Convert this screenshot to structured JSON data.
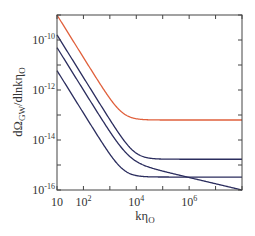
{
  "chart_data": {
    "type": "line",
    "title": "",
    "xlabel": "kη_O",
    "ylabel": "dΩ_GW/dlnkη_O",
    "xscale": "log",
    "yscale": "log",
    "xlim": [
      10,
      100000000
    ],
    "ylim": [
      1e-16,
      1e-09
    ],
    "grid": false,
    "legend": null,
    "x_ticks": [
      {
        "value": 10,
        "base": "10",
        "exp": ""
      },
      {
        "value": 100,
        "base": "10",
        "exp": "2"
      },
      {
        "value": 10000,
        "base": "10",
        "exp": "4"
      },
      {
        "value": 1000000,
        "base": "10",
        "exp": "6"
      }
    ],
    "x_minor_ticks": [
      10,
      100,
      1000,
      10000,
      100000,
      1000000,
      10000000,
      100000000
    ],
    "y_ticks": [
      {
        "value": 1e-10,
        "base": "10",
        "exp": "-10"
      },
      {
        "value": 1e-12,
        "base": "10",
        "exp": "-12"
      },
      {
        "value": 1e-14,
        "base": "10",
        "exp": "-14"
      },
      {
        "value": 1e-16,
        "base": "10",
        "exp": "-16"
      }
    ],
    "y_minor_ticks": [
      1e-09,
      1e-10,
      1e-11,
      1e-12,
      1e-13,
      1e-14,
      1e-15,
      1e-16
    ],
    "series": [
      {
        "name": "red-curve",
        "color": "#e0603c",
        "model": {
          "A": 5e-08,
          "n": 1.7,
          "C": 6.3e-14,
          "D": 0,
          "m": 0
        },
        "approx_points": [
          [
            10,
            1e-09
          ],
          [
            100,
            2.4e-11
          ],
          [
            1000,
            4.5e-13
          ],
          [
            10000,
            6.5e-14
          ],
          [
            1000000,
            6.3e-14
          ],
          [
            100000000,
            6.3e-14
          ]
        ]
      },
      {
        "name": "blue-curve-1",
        "color": "#2b2d5e",
        "model": {
          "A": 8e-09,
          "n": 1.7,
          "C": 1.7e-15,
          "D": 0,
          "m": 0
        },
        "approx_points": [
          [
            10,
            1.6e-10
          ],
          [
            100,
            3.2e-12
          ],
          [
            1000,
            6.8e-15
          ],
          [
            10000,
            2.1e-15
          ],
          [
            1000000,
            1.7e-15
          ],
          [
            100000000,
            1.7e-15
          ]
        ]
      },
      {
        "name": "blue-curve-2",
        "color": "#2b2d5e",
        "model": {
          "A": 2.5e-09,
          "n": 1.7,
          "C": 0,
          "D": 1e-14,
          "m": 0.25
        },
        "approx_points": [
          [
            10,
            5e-11
          ],
          [
            100,
            1.3e-12
          ],
          [
            1000,
            1.9e-15
          ],
          [
            10000,
            1e-15
          ],
          [
            1000000,
            3.2e-16
          ],
          [
            100000000,
            1e-16
          ]
        ]
      },
      {
        "name": "blue-curve-3",
        "color": "#2b2d5e",
        "model": {
          "A": 3e-10,
          "n": 1.7,
          "C": 3.3e-16,
          "D": 0,
          "m": 0
        },
        "approx_points": [
          [
            10,
            6e-12
          ],
          [
            100,
            1.2e-13
          ],
          [
            1000,
            3e-15
          ],
          [
            10000,
            3.8e-16
          ],
          [
            1000000,
            3.3e-16
          ],
          [
            100000000,
            3.3e-16
          ]
        ]
      }
    ]
  },
  "labels": {
    "xlabel_main": "kη",
    "xlabel_sub": "O",
    "ylabel_pre": "dΩ",
    "ylabel_sub1": "GW",
    "ylabel_mid": "/dlnkη",
    "ylabel_sub2": "O"
  }
}
